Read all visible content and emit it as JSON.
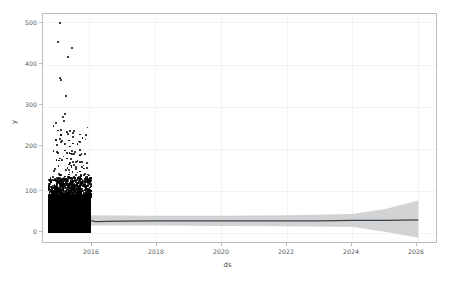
{
  "figure": {
    "background": "#ffffff",
    "axes_color": "#b9bcc0",
    "grid_color": "#f2f3f4"
  },
  "axes": {
    "xlabel": "ds",
    "ylabel": "y",
    "xticks": [
      "2016",
      "2018",
      "2020",
      "2022",
      "2024",
      "2026"
    ],
    "yticks": [
      "0",
      "100",
      "200",
      "300",
      "400",
      "500"
    ]
  },
  "chart_data": {
    "type": "line",
    "title": "",
    "xlabel": "ds",
    "ylabel": "y",
    "xlim": [
      2014.6,
      2026.6
    ],
    "ylim": [
      -25,
      520
    ],
    "xtick_values": [
      2016,
      2018,
      2020,
      2022,
      2024,
      2026
    ],
    "ytick_values": [
      0,
      100,
      200,
      300,
      400,
      500
    ],
    "grid": true,
    "legend": "none",
    "series": [
      {
        "name": "observed",
        "type": "scatter",
        "color": "#000000",
        "marker": "point",
        "x_range": [
          2014.75,
          2016.05
        ],
        "description": "dense black point cloud of historical observations; bulk between 0 and 90, tapering upward with sparse high outliers",
        "outliers": [
          {
            "x": 2015.08,
            "y": 500
          },
          {
            "x": 2015.02,
            "y": 457
          },
          {
            "x": 2015.45,
            "y": 443
          },
          {
            "x": 2015.33,
            "y": 420
          },
          {
            "x": 2015.08,
            "y": 370
          },
          {
            "x": 2015.1,
            "y": 365
          },
          {
            "x": 2015.26,
            "y": 328
          },
          {
            "x": 2015.23,
            "y": 285
          },
          {
            "x": 2015.18,
            "y": 278
          },
          {
            "x": 2015.21,
            "y": 270
          },
          {
            "x": 2014.96,
            "y": 265
          },
          {
            "x": 2015.5,
            "y": 245
          },
          {
            "x": 2015.48,
            "y": 232
          },
          {
            "x": 2015.16,
            "y": 222
          },
          {
            "x": 2015.13,
            "y": 220
          },
          {
            "x": 2015.44,
            "y": 198
          },
          {
            "x": 2015.55,
            "y": 196
          },
          {
            "x": 2015.3,
            "y": 193
          },
          {
            "x": 2015.52,
            "y": 190
          },
          {
            "x": 2015.41,
            "y": 178
          },
          {
            "x": 2015.47,
            "y": 172
          },
          {
            "x": 2014.93,
            "y": 155
          },
          {
            "x": 2015.35,
            "y": 152
          },
          {
            "x": 2015.05,
            "y": 143
          },
          {
            "x": 2015.56,
            "y": 142
          },
          {
            "x": 2015.09,
            "y": 140
          },
          {
            "x": 2015.38,
            "y": 133
          },
          {
            "x": 2015.53,
            "y": 130
          },
          {
            "x": 2014.99,
            "y": 128
          },
          {
            "x": 2015.58,
            "y": 126
          }
        ]
      },
      {
        "name": "yhat",
        "type": "line",
        "color": "#3f4245",
        "description": "forecast mean; wiggles between roughly 22 and 34 during history then flattens near 30 through 2026",
        "points": [
          {
            "x": 2014.8,
            "y": 30
          },
          {
            "x": 2015.0,
            "y": 28
          },
          {
            "x": 2015.2,
            "y": 23
          },
          {
            "x": 2015.4,
            "y": 24
          },
          {
            "x": 2015.6,
            "y": 30
          },
          {
            "x": 2015.8,
            "y": 33
          },
          {
            "x": 2016.0,
            "y": 31
          },
          {
            "x": 2016.2,
            "y": 28
          },
          {
            "x": 2017.0,
            "y": 29
          },
          {
            "x": 2018.0,
            "y": 30
          },
          {
            "x": 2019.0,
            "y": 30
          },
          {
            "x": 2020.0,
            "y": 30
          },
          {
            "x": 2021.0,
            "y": 30
          },
          {
            "x": 2022.0,
            "y": 30
          },
          {
            "x": 2023.0,
            "y": 30
          },
          {
            "x": 2024.0,
            "y": 31
          },
          {
            "x": 2025.0,
            "y": 31
          },
          {
            "x": 2026.0,
            "y": 32
          }
        ]
      },
      {
        "name": "uncertainty_interval",
        "type": "band",
        "color": "#c6c8ca",
        "description": "grey yhat_lower / yhat_upper ribbon; narrow through history, flaring after 2024",
        "points": [
          {
            "x": 2014.8,
            "y_lower": 18,
            "y_upper": 42
          },
          {
            "x": 2016.0,
            "y_lower": 19,
            "y_upper": 43
          },
          {
            "x": 2018.0,
            "y_lower": 19,
            "y_upper": 42
          },
          {
            "x": 2020.0,
            "y_lower": 18,
            "y_upper": 42
          },
          {
            "x": 2022.0,
            "y_lower": 17,
            "y_upper": 43
          },
          {
            "x": 2024.0,
            "y_lower": 15,
            "y_upper": 46
          },
          {
            "x": 2025.0,
            "y_lower": 4,
            "y_upper": 58
          },
          {
            "x": 2026.0,
            "y_lower": -10,
            "y_upper": 78
          }
        ]
      }
    ]
  }
}
